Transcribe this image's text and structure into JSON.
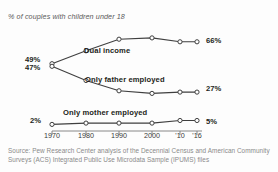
{
  "subtitle": "% of couples with children under 18",
  "source": "Source: Pew Research Center analysis of the Decennial Census and American Community Surveys (ACS) Integrated Public Use Microdata Sample (IPUMS) files",
  "axis": {
    "tick_labels": [
      "1970",
      "1980",
      "1990",
      "2000",
      "'10",
      "'16"
    ]
  },
  "labels": {
    "dual": "Dual income",
    "father": "Only father employed",
    "mother": "Only mother employed",
    "dual_start": "49%",
    "father_start": "47%",
    "mother_start": "2%",
    "dual_end": "66%",
    "father_end": "27%",
    "mother_end": "5%"
  },
  "colors": {
    "line": "#3f3f3f",
    "marker_fill": "#ffffff",
    "text": "#231f20",
    "muted": "#8a8a8a"
  },
  "chart_data": {
    "type": "line",
    "title": "",
    "subtitle": "% of couples with children under 18",
    "xlabel": "",
    "ylabel": "",
    "x": [
      1970,
      1980,
      1990,
      2000,
      2010,
      2016
    ],
    "tick_labels": [
      "1970",
      "1980",
      "1990",
      "2000",
      "'10",
      "'16"
    ],
    "ylim": [
      0,
      75
    ],
    "grid": false,
    "legend": "inline-labels",
    "series": [
      {
        "name": "Dual income",
        "values": [
          49,
          59,
          68,
          69,
          66,
          66
        ],
        "end_label": "66%",
        "start_label": "49%"
      },
      {
        "name": "Only father employed",
        "values": [
          47,
          36,
          28,
          26,
          27,
          27
        ],
        "end_label": "27%",
        "start_label": "47%"
      },
      {
        "name": "Only mother employed",
        "values": [
          2,
          3,
          3,
          3,
          5,
          5
        ],
        "end_label": "5%",
        "start_label": "2%"
      }
    ],
    "annotations": [
      "49%",
      "47%",
      "2%",
      "66%",
      "27%",
      "5%"
    ]
  }
}
